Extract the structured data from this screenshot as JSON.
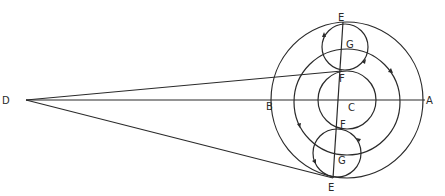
{
  "diagram": {
    "type": "geometric construction (epicycle / rolling circles)",
    "labels": {
      "D": "D",
      "A": "A",
      "B": "B",
      "C": "C",
      "E_top": "E",
      "E_bottom": "E",
      "F_top": "F",
      "F_bottom": "F",
      "G_top": "G",
      "G_bottom": "G"
    },
    "elements": [
      "outer circle centered at C passing through A, B and both E points",
      "middle circle centered at C",
      "inner circle centered at C tangent to small circles at F",
      "upper small circle centered at G between E and F",
      "lower small circle centered at G between F and E",
      "horizontal line D–B–C–A",
      "line from D to upper F",
      "line from D to lower E",
      "line E–G–F–C–F–G–E through center",
      "direction arrows on circles"
    ],
    "colors": {
      "stroke": "#2a2a2a",
      "background": "#ffffff"
    }
  }
}
